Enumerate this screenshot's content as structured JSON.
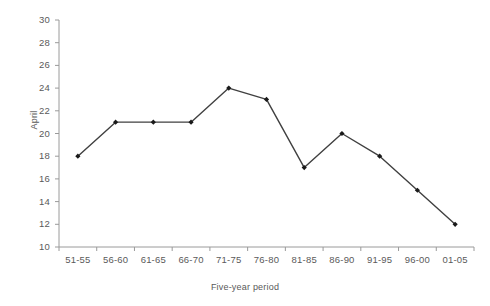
{
  "chart_data": {
    "type": "line",
    "title": "",
    "xlabel": "Five-year period",
    "ylabel": "April",
    "categories": [
      "51-55",
      "56-60",
      "61-65",
      "66-70",
      "71-75",
      "76-80",
      "81-85",
      "86-90",
      "91-95",
      "96-00",
      "01-05"
    ],
    "values": [
      18,
      21,
      21,
      21,
      24,
      23,
      17,
      20,
      18,
      15,
      12
    ],
    "ylim": [
      10,
      30
    ],
    "ytick_step": 2,
    "yticks": [
      30,
      28,
      26,
      24,
      22,
      20,
      18,
      16,
      14,
      12,
      10
    ],
    "grid": false,
    "legend": null,
    "marker": "filled-diamond",
    "line_color": "#404040",
    "marker_color": "#1a1a1a",
    "axis_color": "#9a9a9a",
    "text_color": "#5a5a5a",
    "background": "#ffffff"
  }
}
